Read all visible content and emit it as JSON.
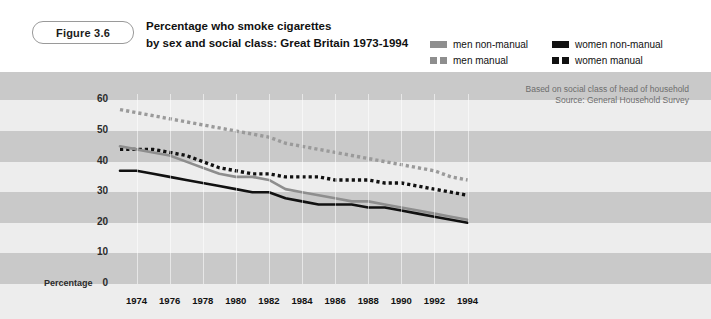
{
  "figure": {
    "badge": "Figure 3.6",
    "title_line1": "Percentage who smoke cigarettes",
    "title_line2": "by sex and social class: Great Britain 1973-1994"
  },
  "legend": {
    "items": [
      {
        "label": "men non-manual",
        "style": "solid",
        "color": "#8e8e8e"
      },
      {
        "label": "women non-manual",
        "style": "solid",
        "color": "#111111"
      },
      {
        "label": "men manual",
        "style": "dashed",
        "color": "#8e8e8e"
      },
      {
        "label": "women manual",
        "style": "dashed",
        "color": "#111111"
      }
    ]
  },
  "notes": {
    "line1": "Based on social class of head of household",
    "line2": "Source: General Household Survey"
  },
  "axis": {
    "y_label": "Percentage",
    "y_ticks": [
      "60",
      "50",
      "40",
      "30",
      "20",
      "10",
      "0"
    ],
    "x_ticks": [
      "1974",
      "1976",
      "1978",
      "1980",
      "1982",
      "1984",
      "1986",
      "1988",
      "1990",
      "1992",
      "1994"
    ]
  },
  "chart_data": {
    "type": "line",
    "title": "Percentage who smoke cigarettes by sex and social class: Great Britain 1973-1994",
    "xlabel": "",
    "ylabel": "Percentage",
    "ylim": [
      0,
      60
    ],
    "xlim": [
      1973,
      1994
    ],
    "grid": "horizontal-bands",
    "legend_position": "top-right",
    "annotations": [
      "Based on social class of head of household",
      "Source: General Household Survey"
    ],
    "x": [
      1973,
      1974,
      1975,
      1976,
      1977,
      1978,
      1979,
      1980,
      1981,
      1982,
      1983,
      1984,
      1985,
      1986,
      1987,
      1988,
      1989,
      1990,
      1991,
      1992,
      1993,
      1994
    ],
    "series": [
      {
        "name": "men manual",
        "color": "#9a9a9a",
        "style": "dashed",
        "values": [
          57,
          56,
          55,
          54,
          53,
          52,
          51,
          50,
          49,
          48,
          46,
          45,
          44,
          43,
          42,
          41,
          40,
          39,
          38,
          37,
          35,
          34
        ]
      },
      {
        "name": "women manual",
        "color": "#111111",
        "style": "dashed",
        "values": [
          44,
          44,
          44,
          43,
          42,
          40,
          38,
          37,
          36,
          36,
          35,
          35,
          35,
          34,
          34,
          34,
          33,
          33,
          32,
          31,
          30,
          29
        ]
      },
      {
        "name": "men non-manual",
        "color": "#8e8e8e",
        "style": "solid",
        "values": [
          45,
          44,
          43,
          42,
          40,
          38,
          36,
          35,
          35,
          34,
          31,
          30,
          29,
          28,
          27,
          27,
          26,
          25,
          24,
          23,
          22,
          21
        ]
      },
      {
        "name": "women non-manual",
        "color": "#111111",
        "style": "solid",
        "values": [
          37,
          37,
          36,
          35,
          34,
          33,
          32,
          31,
          30,
          30,
          28,
          27,
          26,
          26,
          26,
          25,
          25,
          24,
          23,
          22,
          21,
          20
        ]
      }
    ]
  }
}
